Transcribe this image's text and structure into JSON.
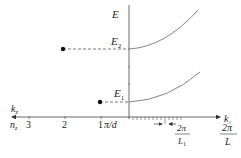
{
  "diagram": {
    "axes": {
      "vertical_label": "E",
      "right_label": "k",
      "right_label_sub": "//",
      "left_label": "k",
      "left_label_sub": "z",
      "left_row_label": "n",
      "left_row_label_sub": "z"
    },
    "levels": [
      {
        "label": "E",
        "sub": "2",
        "n": "2"
      },
      {
        "label": "E",
        "sub": "1",
        "n": "1"
      }
    ],
    "left_ticks": [
      "3",
      "2",
      "1"
    ],
    "pi_over_d": "π/d",
    "fractions": [
      {
        "num": "2π",
        "den": "L",
        "den_sub": "1"
      },
      {
        "num": "2π",
        "den": "L",
        "den_sub": ""
      }
    ],
    "colors": {
      "axis": "#333333",
      "curve": "#777777",
      "dot": "#111111"
    }
  }
}
